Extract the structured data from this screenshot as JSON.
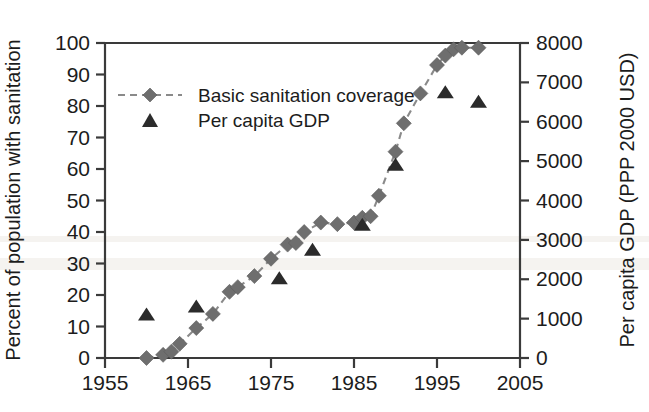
{
  "figure": {
    "background_color": "#ffffff",
    "plot_area": {
      "left": 105,
      "right": 520,
      "top": 43,
      "bottom": 358
    }
  },
  "axes": {
    "x": {
      "label": "",
      "tick_labels": [
        "1955",
        "1965",
        "1975",
        "1985",
        "1995",
        "2005"
      ],
      "tick_values": [
        1955,
        1965,
        1975,
        1985,
        1995,
        2005
      ],
      "range": [
        1955,
        2005
      ]
    },
    "y_left": {
      "label": "Percent of population with sanitation",
      "tick_labels": [
        "0",
        "10",
        "20",
        "30",
        "40",
        "50",
        "60",
        "70",
        "80",
        "90",
        "100"
      ],
      "tick_values": [
        0,
        10,
        20,
        30,
        40,
        50,
        60,
        70,
        80,
        90,
        100
      ],
      "range": [
        0,
        100
      ]
    },
    "y_right": {
      "label": "Per capita GDP (PPP 2000 USD)",
      "tick_labels": [
        "0",
        "1000",
        "2000",
        "3000",
        "4000",
        "5000",
        "6000",
        "7000",
        "8000"
      ],
      "tick_values": [
        0,
        1000,
        2000,
        3000,
        4000,
        5000,
        6000,
        7000,
        8000
      ],
      "range": [
        0,
        8000
      ]
    }
  },
  "legend": {
    "position": "upper-left-inside",
    "entries": [
      {
        "label": "Basic sanitation coverage",
        "marker": "diamond",
        "line": "dashed",
        "color": "#6e6e6e"
      },
      {
        "label": "Per capita GDP",
        "marker": "triangle",
        "line": "none",
        "color": "#2b2b2b"
      }
    ]
  },
  "colors": {
    "sanitation_marker": "#6e6e6e",
    "sanitation_line": "#8a8a8a",
    "gdp_marker": "#2b2b2b",
    "axis": "#3a3a3a",
    "text": "#1c1c1c"
  },
  "chart_data": {
    "type": "line",
    "title": "",
    "xlabel": "",
    "ylabel": "Percent of population with sanitation",
    "y2label": "Per capita GDP (PPP 2000 USD)",
    "xlim": [
      1955,
      2005
    ],
    "ylim": [
      0,
      100
    ],
    "y2lim": [
      0,
      8000
    ],
    "grid": false,
    "series": [
      {
        "name": "Basic sanitation coverage",
        "axis": "left",
        "unit": "percent",
        "marker": "diamond",
        "linestyle": "dashed",
        "color": "#6e6e6e",
        "points": [
          {
            "x": 1960,
            "y": 0
          },
          {
            "x": 1962,
            "y": 1
          },
          {
            "x": 1963,
            "y": 2
          },
          {
            "x": 1964,
            "y": 4.5
          },
          {
            "x": 1966,
            "y": 9.5
          },
          {
            "x": 1968,
            "y": 14
          },
          {
            "x": 1970,
            "y": 21
          },
          {
            "x": 1971,
            "y": 22.5
          },
          {
            "x": 1973,
            "y": 26
          },
          {
            "x": 1975,
            "y": 31.5
          },
          {
            "x": 1977,
            "y": 36
          },
          {
            "x": 1978,
            "y": 36.5
          },
          {
            "x": 1979,
            "y": 40
          },
          {
            "x": 1981,
            "y": 43
          },
          {
            "x": 1983,
            "y": 42.5
          },
          {
            "x": 1985,
            "y": 43
          },
          {
            "x": 1986,
            "y": 44.5
          },
          {
            "x": 1987,
            "y": 45
          },
          {
            "x": 1988,
            "y": 51.5
          },
          {
            "x": 1990,
            "y": 65.5
          },
          {
            "x": 1991,
            "y": 74.5
          },
          {
            "x": 1993,
            "y": 84
          },
          {
            "x": 1995,
            "y": 93
          },
          {
            "x": 1996,
            "y": 96
          },
          {
            "x": 1997,
            "y": 98
          },
          {
            "x": 1998,
            "y": 98.5
          },
          {
            "x": 2000,
            "y": 98.5
          }
        ]
      },
      {
        "name": "Per capita GDP",
        "axis": "right",
        "unit": "PPP 2000 USD",
        "marker": "triangle",
        "linestyle": "none",
        "color": "#2b2b2b",
        "points": [
          {
            "x": 1960,
            "y": 1080
          },
          {
            "x": 1966,
            "y": 1280
          },
          {
            "x": 1976,
            "y": 2000
          },
          {
            "x": 1980,
            "y": 2720
          },
          {
            "x": 1986,
            "y": 3360
          },
          {
            "x": 1990,
            "y": 4880
          },
          {
            "x": 1996,
            "y": 6720
          },
          {
            "x": 2000,
            "y": 6480
          }
        ]
      }
    ]
  }
}
